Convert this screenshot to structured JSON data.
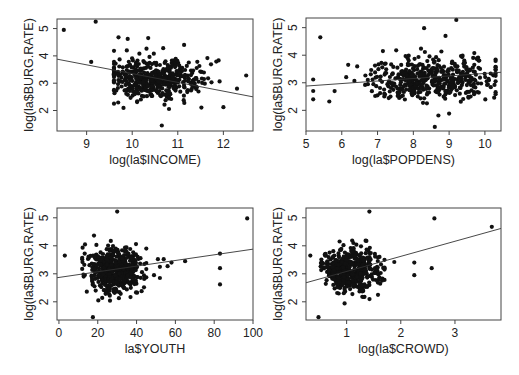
{
  "figure": {
    "layout": "2x2 scatterplot matrix",
    "width": 519,
    "height": 375
  },
  "chart_data": [
    {
      "type": "scatter",
      "id": "income",
      "title": "",
      "xlabel": "log(la$INCOME)",
      "ylabel": "log(la$BURG.RATE)",
      "xlim": [
        8.35,
        12.65
      ],
      "ylim": [
        1.25,
        5.35
      ],
      "xticks": [
        9,
        10,
        11,
        12
      ],
      "yticks": [
        2,
        3,
        4,
        5
      ],
      "box": {
        "x0": 57,
        "x1": 253,
        "y0": 19,
        "y1": 131
      },
      "regression_line": {
        "x": [
          8.35,
          12.65
        ],
        "y": [
          3.88,
          2.5
        ]
      },
      "cluster": {
        "x_mean": 10.45,
        "x_sd": 0.45,
        "y_mean": 3.15,
        "y_sd": 0.38,
        "n": 480,
        "x_min": 9.6,
        "x_max": 12.5
      },
      "outliers": [
        [
          8.5,
          4.95
        ],
        [
          9.2,
          5.25
        ],
        [
          9.1,
          3.78
        ],
        [
          10.65,
          1.45
        ],
        [
          10.35,
          4.65
        ],
        [
          9.7,
          4.68
        ],
        [
          9.9,
          4.62
        ],
        [
          12.5,
          3.28
        ],
        [
          12.3,
          2.8
        ],
        [
          11.65,
          3.92
        ],
        [
          12.0,
          2.12
        ]
      ],
      "grid": false,
      "legend": null
    },
    {
      "type": "scatter",
      "id": "popdens",
      "title": "",
      "xlabel": "log(la$POPDENS)",
      "ylabel": "log(la$BURG.RATE)",
      "xlim": [
        5.0,
        10.45
      ],
      "ylim": [
        1.25,
        5.35
      ],
      "xticks": [
        5,
        6,
        7,
        8,
        9,
        10
      ],
      "yticks": [
        2,
        3,
        4,
        5
      ],
      "box": {
        "x0": 306,
        "x1": 501,
        "y0": 18,
        "y1": 131
      },
      "regression_line": {
        "x": [
          5.0,
          10.45
        ],
        "y": [
          2.88,
          3.38
        ]
      },
      "cluster": {
        "x_mean": 8.45,
        "x_sd": 0.75,
        "y_mean": 3.15,
        "y_sd": 0.4,
        "n": 480,
        "x_min": 5.8,
        "x_max": 10.3
      },
      "outliers": [
        [
          5.4,
          4.65
        ],
        [
          5.2,
          3.12
        ],
        [
          5.2,
          2.7
        ],
        [
          5.2,
          2.4
        ],
        [
          5.65,
          2.32
        ],
        [
          8.3,
          4.98
        ],
        [
          9.2,
          5.28
        ],
        [
          8.6,
          1.4
        ],
        [
          8.9,
          4.7
        ],
        [
          10.3,
          3.58
        ],
        [
          9.0,
          1.88
        ]
      ],
      "grid": false,
      "legend": null
    },
    {
      "type": "scatter",
      "id": "youth",
      "title": "",
      "xlabel": "la$YOUTH",
      "ylabel": "log(la$BURG.RATE)",
      "xlim": [
        -1,
        100
      ],
      "ylim": [
        1.35,
        5.35
      ],
      "xticks": [
        0,
        20,
        40,
        60,
        80,
        100
      ],
      "yticks": [
        2,
        3,
        4,
        5
      ],
      "box": {
        "x0": 57,
        "x1": 253,
        "y0": 208,
        "y1": 320
      },
      "regression_line": {
        "x": [
          -1,
          100
        ],
        "y": [
          2.86,
          3.88
        ]
      },
      "cluster": {
        "x_mean": 27.5,
        "x_sd": 6.0,
        "y_mean": 3.12,
        "y_sd": 0.4,
        "n": 500,
        "x_min": 12,
        "x_max": 45
      },
      "outliers": [
        [
          3,
          3.65
        ],
        [
          30,
          5.22
        ],
        [
          17.5,
          1.45
        ],
        [
          97,
          4.98
        ],
        [
          83,
          3.72
        ],
        [
          83,
          3.2
        ],
        [
          83,
          2.62
        ],
        [
          65,
          3.45
        ],
        [
          58,
          3.4
        ],
        [
          56,
          3.27
        ],
        [
          54,
          3.52
        ],
        [
          51,
          3.52
        ],
        [
          52,
          2.85
        ],
        [
          49,
          2.95
        ],
        [
          45,
          3.9
        ],
        [
          44,
          3.35
        ],
        [
          52,
          3.25
        ]
      ],
      "grid": false,
      "legend": null
    },
    {
      "type": "scatter",
      "id": "crowd",
      "title": "",
      "xlabel": "log(la$CROWD)",
      "ylabel": "log(la$BURG.RATE)",
      "xlim": [
        0.25,
        3.85
      ],
      "ylim": [
        1.35,
        5.35
      ],
      "xticks": [
        1,
        2,
        3
      ],
      "yticks": [
        2,
        3,
        4,
        5
      ],
      "box": {
        "x0": 306,
        "x1": 501,
        "y0": 208,
        "y1": 320
      },
      "regression_line": {
        "x": [
          0.25,
          3.85
        ],
        "y": [
          2.68,
          4.62
        ]
      },
      "cluster": {
        "x_mean": 1.05,
        "x_sd": 0.22,
        "y_mean": 3.12,
        "y_sd": 0.4,
        "n": 500,
        "x_min": 0.4,
        "x_max": 1.7
      },
      "outliers": [
        [
          1.42,
          5.22
        ],
        [
          2.62,
          4.98
        ],
        [
          3.68,
          4.68
        ],
        [
          0.33,
          3.65
        ],
        [
          0.48,
          1.45
        ],
        [
          2.25,
          3.4
        ],
        [
          2.25,
          2.95
        ],
        [
          2.57,
          3.2
        ],
        [
          1.88,
          3.42
        ],
        [
          1.7,
          3.5
        ],
        [
          1.58,
          2.25
        ]
      ],
      "grid": false,
      "legend": null
    }
  ]
}
